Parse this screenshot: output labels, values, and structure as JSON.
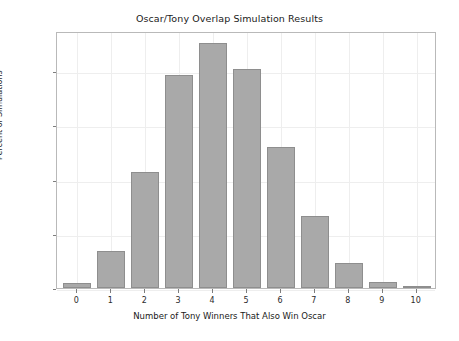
{
  "chart_data": {
    "type": "bar",
    "title": "Oscar/Tony Overlap Simulation Results",
    "xlabel": "Number of Tony Winners That Also Win Oscar",
    "ylabel": "Percent of Simulations",
    "categories": [
      "0",
      "1",
      "2",
      "3",
      "4",
      "5",
      "6",
      "7",
      "8",
      "9",
      "10"
    ],
    "values": [
      0.5,
      3.4,
      10.7,
      19.6,
      22.6,
      20.2,
      13.0,
      6.6,
      2.3,
      0.6,
      0.1
    ],
    "ylim": [
      0,
      23.7
    ],
    "xlim": [
      -0.6,
      10.6
    ],
    "ytick_values": [
      0,
      5,
      10,
      15,
      20
    ],
    "ytick_labels": [
      "0%",
      "5%",
      "10%",
      "15%",
      "20%"
    ],
    "xtick_labels": [
      "0",
      "1",
      "2",
      "3",
      "4",
      "5",
      "6",
      "7",
      "8",
      "9",
      "10"
    ],
    "grid": true,
    "legend": null,
    "bar_color": "#a9a9a9",
    "bar_edge_color": "#8e8e8e",
    "grid_color": "#eeeeee",
    "frame_color": "#b9b9b9",
    "bar_width": 0.82
  }
}
